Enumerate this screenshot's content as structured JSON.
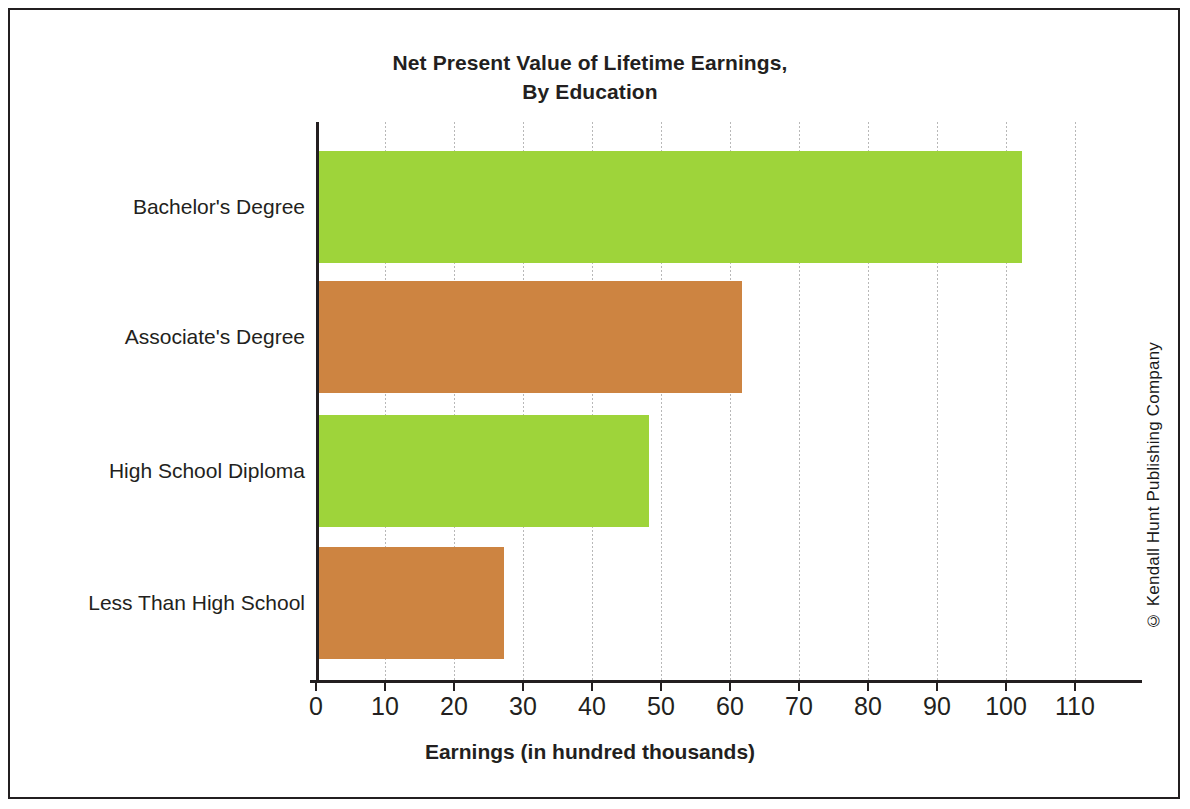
{
  "figure": {
    "border_color": "#231f20",
    "background": "#ffffff",
    "copyright": "© Kendall Hunt Publishing Company"
  },
  "chart_data": {
    "type": "bar",
    "orientation": "horizontal",
    "title": "Net Present Value of Lifetime Earnings,",
    "title_line2": "By Education",
    "subtitle": "",
    "xlabel": "Earnings (in hundred thousands)",
    "ylabel": "",
    "categories": [
      "Bachelor's Degree",
      "Associate's Degree",
      "High School Diploma",
      "Less Than High School"
    ],
    "values": [
      102,
      61.5,
      48,
      27
    ],
    "bar_colors": [
      "#9ed43a",
      "#cd8441",
      "#9ed43a",
      "#cd8441"
    ],
    "xlim": [
      0,
      110
    ],
    "xticks": [
      0,
      10,
      20,
      30,
      40,
      50,
      60,
      70,
      80,
      90,
      100,
      110
    ],
    "xtick_labels": [
      "0",
      "10",
      "20",
      "30",
      "40",
      "50",
      "60",
      "70",
      "80",
      "90",
      "100",
      "110"
    ],
    "grid": "vertical-dotted",
    "grid_color": "#b8b8b8",
    "legend": "none",
    "axis_color": "#231f20"
  }
}
